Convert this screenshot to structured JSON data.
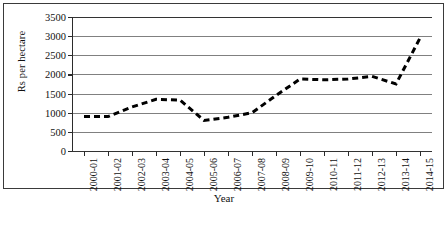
{
  "chart_data": {
    "type": "line",
    "title": "",
    "xlabel": "Year",
    "ylabel": "Rs per hectare",
    "categories": [
      "2000-01",
      "2001-02",
      "2002-03",
      "2003-04",
      "2004-05",
      "2005-06",
      "2006-07",
      "2007-08",
      "2008-09",
      "2009-10",
      "2010-11",
      "2011-12",
      "2012-13",
      "2013-14",
      "2014-15"
    ],
    "values": [
      900,
      900,
      1150,
      1350,
      1330,
      800,
      880,
      1000,
      1450,
      1880,
      1860,
      1880,
      1950,
      1750,
      2950
    ],
    "series": [
      {
        "name": "Rs per hectare",
        "values": [
          900,
          900,
          1150,
          1350,
          1330,
          800,
          880,
          1000,
          1450,
          1880,
          1860,
          1880,
          1950,
          1750,
          2950
        ],
        "style": "dashed",
        "color": "#000000"
      }
    ],
    "ylim": [
      0,
      3500
    ],
    "yticks": [
      0,
      500,
      1000,
      1500,
      2000,
      2500,
      3000,
      3500
    ],
    "ytick_labels": [
      "0",
      "500",
      "1000",
      "1500",
      "2000",
      "2500",
      "3000",
      "3500"
    ],
    "grid": true,
    "grid_axis": "y",
    "legend": false,
    "legend_position": "none",
    "line_color": "#000000",
    "grid_color": "#808080",
    "axis_color": "#2b2b2b",
    "background": "#ffffff"
  }
}
